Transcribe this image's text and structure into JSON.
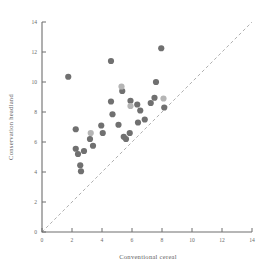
{
  "figure": {
    "background": "#ffffff",
    "width": 261,
    "height": 268
  },
  "axis": {
    "x_title": "Conventional cereal",
    "y_title": "Conservation headland",
    "x_ticks": [
      "0",
      "2",
      "4",
      "6",
      "8",
      "10",
      "12",
      "14"
    ],
    "y_ticks": [
      "0",
      "2",
      "4",
      "6",
      "8",
      "10",
      "12",
      "14"
    ],
    "axis_color": "#6e6e6e",
    "tick_color": "#6b6b6b"
  },
  "reference_line": {
    "label": "1:1 line",
    "style": "dashed",
    "color": "#a7a7a7",
    "from": [
      0,
      0
    ],
    "to": [
      14,
      14
    ]
  },
  "marker_colors": {
    "dark": "#707070",
    "light": "#b5b5b5"
  },
  "chart_data": {
    "type": "scatter",
    "title": "",
    "xlabel": "Conventional cereal",
    "ylabel": "Conservation headland",
    "xlim": [
      0,
      14
    ],
    "ylim": [
      0,
      14
    ],
    "xticks": [
      0,
      2,
      4,
      6,
      8,
      10,
      12,
      14
    ],
    "yticks": [
      0,
      2,
      4,
      6,
      8,
      10,
      12,
      14
    ],
    "grid": false,
    "legend": "none",
    "annotations": [
      "dashed 1:1 reference line from (0,0) to (14,14)"
    ],
    "series": [
      {
        "name": "dark points",
        "color": "#707070",
        "points": [
          [
            1.75,
            10.35
          ],
          [
            2.25,
            6.85
          ],
          [
            2.25,
            5.55
          ],
          [
            2.4,
            5.2
          ],
          [
            2.55,
            4.45
          ],
          [
            2.6,
            4.05
          ],
          [
            2.8,
            5.4
          ],
          [
            3.2,
            6.2
          ],
          [
            3.4,
            5.75
          ],
          [
            3.95,
            7.1
          ],
          [
            4.05,
            6.6
          ],
          [
            4.6,
            11.4
          ],
          [
            4.6,
            8.7
          ],
          [
            4.7,
            7.85
          ],
          [
            5.1,
            7.15
          ],
          [
            5.35,
            9.4
          ],
          [
            5.45,
            6.35
          ],
          [
            5.6,
            6.2
          ],
          [
            5.85,
            6.6
          ],
          [
            5.9,
            8.75
          ],
          [
            6.35,
            8.5
          ],
          [
            6.4,
            7.3
          ],
          [
            6.55,
            8.1
          ],
          [
            6.85,
            7.5
          ],
          [
            7.25,
            8.6
          ],
          [
            7.5,
            8.95
          ],
          [
            7.6,
            10.0
          ],
          [
            7.95,
            12.25
          ],
          [
            8.15,
            8.3
          ]
        ]
      },
      {
        "name": "light points",
        "color": "#b5b5b5",
        "points": [
          [
            3.25,
            6.6
          ],
          [
            5.3,
            9.7
          ],
          [
            5.9,
            8.4
          ],
          [
            8.1,
            8.9
          ]
        ]
      }
    ]
  }
}
